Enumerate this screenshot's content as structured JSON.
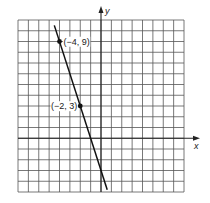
{
  "chart_data": {
    "type": "line",
    "title": "",
    "xlabel": "x",
    "ylabel": "y",
    "xlim": [
      -8,
      8
    ],
    "ylim": [
      -5,
      11
    ],
    "grid": true,
    "series": [
      {
        "name": "line",
        "equation": "y = -3x - 3",
        "x": [
          -4.5,
          0.6
        ],
        "y": [
          10.5,
          -4.8
        ]
      }
    ],
    "points": [
      {
        "x": -4,
        "y": 9,
        "label": "(−4, 9)"
      },
      {
        "x": -2,
        "y": 3,
        "label": "(−2, 3)"
      }
    ]
  }
}
